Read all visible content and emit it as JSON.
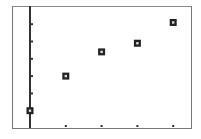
{
  "chart_data": {
    "type": "scatter",
    "title": "",
    "xlabel": "",
    "ylabel": "",
    "x": [
      0,
      1,
      2,
      3,
      4
    ],
    "series": [
      {
        "name": "data",
        "marker": "square",
        "values": [
          1.0,
          3.0,
          4.4,
          4.9,
          6.1
        ]
      }
    ],
    "x_ticks": [
      1,
      2,
      3,
      4
    ],
    "y_ticks": [
      1,
      2,
      3,
      4,
      5,
      6
    ],
    "xlim": [
      -0.5,
      4.5
    ],
    "ylim": [
      0,
      7
    ],
    "grid": false,
    "legend": null,
    "colors": {
      "axis": "#333333",
      "frame": "#777777",
      "marker": "#222222",
      "background": "#ffffff"
    }
  }
}
